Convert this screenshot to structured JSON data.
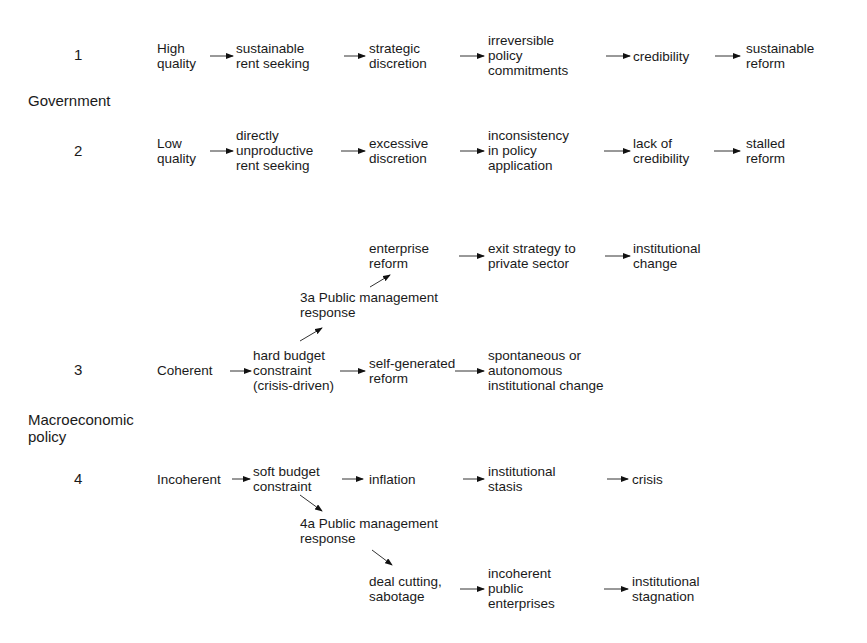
{
  "sections": {
    "government": "Government",
    "macro": "Macroeconomic\npolicy"
  },
  "rows": {
    "r1": {
      "number": "1",
      "nodes": [
        "High\nquality",
        "sustainable\nrent seeking",
        "strategic\ndiscretion",
        "irreversible\npolicy\ncommitments",
        "credibility",
        "sustainable\nreform"
      ]
    },
    "r2": {
      "number": "2",
      "nodes": [
        "Low\nquality",
        "directly\nunproductive\nrent seeking",
        "excessive\ndiscretion",
        "inconsistency\nin policy\napplication",
        "lack of\ncredibility",
        "stalled\nreform"
      ]
    },
    "r3": {
      "number": "3",
      "nodes": [
        "Coherent",
        "hard budget\nconstraint\n(crisis-driven)",
        "self-generated\nreform",
        "spontaneous or\nautonomous\ninstitutional change"
      ],
      "branch": {
        "label": "3a Public management\nresponse",
        "nodes": [
          "enterprise\nreform",
          "exit strategy to\nprivate sector",
          "institutional\nchange"
        ]
      }
    },
    "r4": {
      "number": "4",
      "nodes": [
        "Incoherent",
        "soft budget\nconstraint",
        "inflation",
        "institutional\nstasis",
        "crisis"
      ],
      "branch": {
        "label": "4a Public management\nresponse",
        "nodes": [
          "deal cutting,\nsabotage",
          "incoherent\npublic\nenterprises",
          "institutional\nstagnation"
        ]
      }
    }
  }
}
